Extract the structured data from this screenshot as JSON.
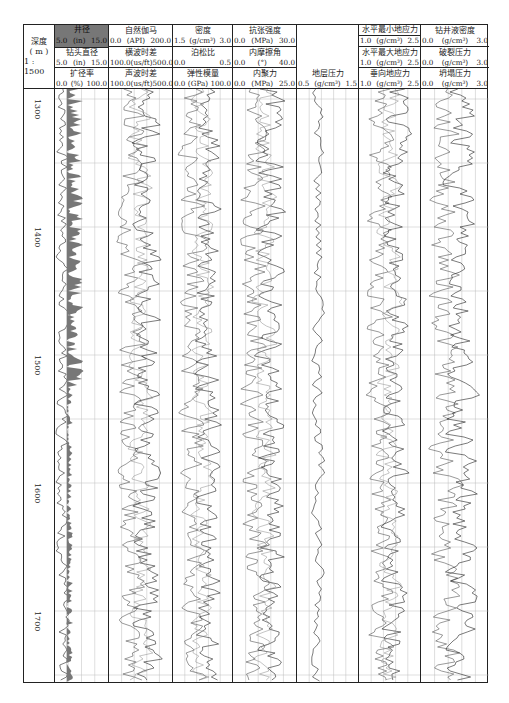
{
  "chart_data": {
    "type": "line",
    "depth_axis": {
      "label": "深度",
      "unit": "(m)",
      "scale": "1 : 1500",
      "range": [
        1280,
        1740
      ],
      "ticks": [
        1300,
        1400,
        1500,
        1600,
        1700
      ]
    },
    "tracks": [
      {
        "id": "t1",
        "curves": [
          {
            "name": "井径",
            "unit": "(in)",
            "min": 5.0,
            "max": 15.0,
            "fill": true
          },
          {
            "name": "钻头直径",
            "unit": "(in)",
            "min": 5.0,
            "max": 15.0
          },
          {
            "name": "扩径率",
            "unit": "(%)",
            "min": 0.0,
            "max": 100.0
          }
        ]
      },
      {
        "id": "t2",
        "curves": [
          {
            "name": "自然伽马",
            "unit": "(API)",
            "min": 0.0,
            "max": 200.0
          },
          {
            "name": "横波时差",
            "unit": "(us/ft)",
            "min": 100.0,
            "max": 500.0
          },
          {
            "name": "声波时差",
            "unit": "(us/ft)",
            "min": 100.0,
            "max": 500.0
          }
        ]
      },
      {
        "id": "t3",
        "curves": [
          {
            "name": "密度",
            "unit": "(g/cm³)",
            "min": 1.5,
            "max": 3.0
          },
          {
            "name": "泊松比",
            "unit": "",
            "min": 0.0,
            "max": 0.5
          },
          {
            "name": "弹性模量",
            "unit": "(GPa)",
            "min": 0.0,
            "max": 100.0
          }
        ]
      },
      {
        "id": "t4",
        "curves": [
          {
            "name": "抗张强度",
            "unit": "(MPa)",
            "min": 0.0,
            "max": 30.0
          },
          {
            "name": "内摩擦角",
            "unit": "(°)",
            "min": 0.0,
            "max": 40.0
          },
          {
            "name": "内聚力",
            "unit": "(MPa)",
            "min": 0.0,
            "max": 25.0
          }
        ]
      },
      {
        "id": "t5",
        "curves": [
          {
            "name": "地层压力",
            "unit": "(g/cm³)",
            "min": 0.5,
            "max": 1.5
          }
        ]
      },
      {
        "id": "t6",
        "curves": [
          {
            "name": "水平最小地应力",
            "unit": "(g/cm³)",
            "min": 1.0,
            "max": 2.5
          },
          {
            "name": "水平最大地应力",
            "unit": "(g/cm³)",
            "min": 1.0,
            "max": 2.5
          },
          {
            "name": "垂向地应力",
            "unit": "(g/cm³)",
            "min": 1.0,
            "max": 2.5
          }
        ]
      },
      {
        "id": "t7",
        "curves": [
          {
            "name": "钻井液密度",
            "unit": "(g/cm³)",
            "min": 0.0,
            "max": 3.0
          },
          {
            "name": "破裂压力",
            "unit": "(g/cm³)",
            "min": 0.0,
            "max": 3.0
          },
          {
            "name": "坍塌压力",
            "unit": "(g/cm³)",
            "min": 0.0,
            "max": 3.0
          }
        ]
      }
    ],
    "grid": true
  },
  "header": {
    "depth": {
      "line1": "深度",
      "line2": "( m )",
      "line3": "1 : 1500"
    },
    "t1": {
      "c1_name": "井径",
      "c1_min": "5.0",
      "c1_unit": "(in)",
      "c1_max": "15.0",
      "c2_name": "钻头直径",
      "c2_min": "5.0",
      "c2_unit": "(in)",
      "c2_max": "15.0",
      "c3_name": "扩径率",
      "c3_min": "0.0",
      "c3_unit": "(%)",
      "c3_max": "100.0"
    },
    "t2": {
      "c1_name": "自然伽马",
      "c1_min": "0.0",
      "c1_unit": "(API)",
      "c1_max": "200.0",
      "c2_name": "横波时差",
      "c2_min": "100.0",
      "c2_unit": "(us/ft)",
      "c2_max": "500.0",
      "c3_name": "声波时差",
      "c3_min": "100.0",
      "c3_unit": "(us/ft)",
      "c3_max": "500.0"
    },
    "t3": {
      "c1_name": "密度",
      "c1_min": "1.5",
      "c1_unit": "(g/cm³)",
      "c1_max": "3.0",
      "c2_name": "泊松比",
      "c2_min": "0.0",
      "c2_unit": "",
      "c2_max": "0.5",
      "c3_name": "弹性模量",
      "c3_min": "0.0",
      "c3_unit": "(GPa)",
      "c3_max": "100.0"
    },
    "t4": {
      "c1_name": "抗张强度",
      "c1_min": "0.0",
      "c1_unit": "(MPa)",
      "c1_max": "30.0",
      "c2_name": "内摩擦角",
      "c2_min": "0.0",
      "c2_unit": "(°)",
      "c2_max": "40.0",
      "c3_name": "内聚力",
      "c3_min": "0.0",
      "c3_unit": "(MPa)",
      "c3_max": "25.0"
    },
    "t5": {
      "c1_name": "地层压力",
      "c1_min": "0.5",
      "c1_unit": "(g/cm³)",
      "c1_max": "1.5"
    },
    "t6": {
      "c1_name": "水平最小地应力",
      "c1_min": "1.0",
      "c1_unit": "(g/cm³)",
      "c1_max": "2.5",
      "c2_name": "水平最大地应力",
      "c2_min": "1.0",
      "c2_unit": "(g/cm³)",
      "c2_max": "2.5",
      "c3_name": "垂向地应力",
      "c3_min": "1.0",
      "c3_unit": "(g/cm³)",
      "c3_max": "2.5"
    },
    "t7": {
      "c1_name": "钻井液密度",
      "c1_min": "0.0",
      "c1_unit": "(g/cm³)",
      "c1_max": "3.0",
      "c2_name": "破裂压力",
      "c2_min": "0.0",
      "c2_unit": "(g/cm³)",
      "c2_max": "3.0",
      "c3_name": "坍塌压力",
      "c3_min": "0.0",
      "c3_unit": "(g/cm³)",
      "c3_max": "3.0"
    }
  },
  "depth_labels": [
    "1300",
    "1400",
    "1500",
    "1600",
    "1700"
  ],
  "colors": {
    "line": "#222222",
    "fill": "#777777",
    "grid": "#bbbbbb",
    "border": "#222222"
  }
}
